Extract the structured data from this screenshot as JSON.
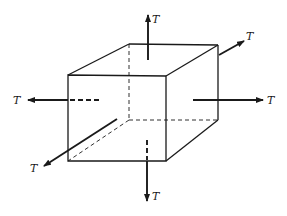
{
  "diagram": {
    "stroke_color": "#1a1a1a",
    "background": "#ffffff",
    "cube": {
      "front_face": {
        "tl": [
          68,
          75
        ],
        "tr": [
          166,
          76
        ],
        "br": [
          166,
          161
        ],
        "bl": [
          68,
          161
        ]
      },
      "back_face": {
        "tl": [
          129,
          44
        ],
        "tr": [
          218,
          45
        ],
        "br": [
          218,
          120
        ],
        "bl": [
          129,
          120
        ]
      }
    },
    "forces": [
      {
        "id": "top",
        "label": "T",
        "direction": "up"
      },
      {
        "id": "bottom",
        "label": "T",
        "direction": "down"
      },
      {
        "id": "left",
        "label": "T",
        "direction": "left"
      },
      {
        "id": "right",
        "label": "T",
        "direction": "right"
      },
      {
        "id": "back",
        "label": "T",
        "direction": "up-right"
      },
      {
        "id": "front",
        "label": "T",
        "direction": "down-left"
      }
    ]
  }
}
